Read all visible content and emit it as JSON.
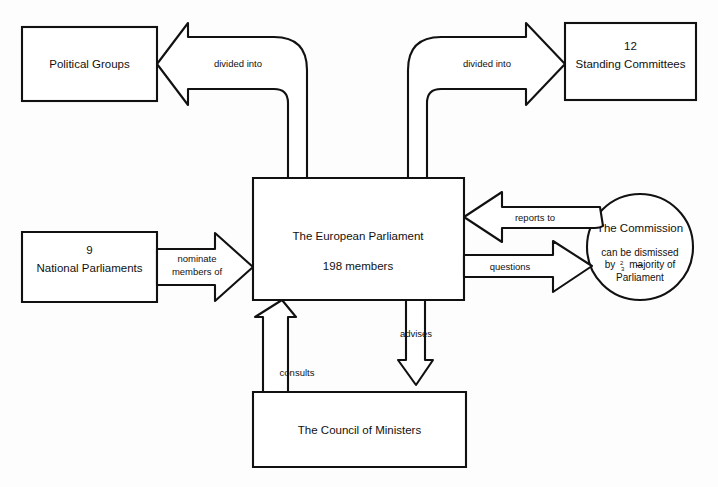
{
  "diagram": {
    "background_color": "#fdfdfd",
    "line_color": "#111111",
    "fill_color": "#ffffff",
    "nodes": {
      "political_groups": {
        "label": "Political Groups"
      },
      "standing_committees": {
        "count": "12",
        "label": "Standing Committees"
      },
      "national_parliaments": {
        "count": "9",
        "label": "National Parliaments"
      },
      "parliament": {
        "label": "The European Parliament",
        "members": "198 members"
      },
      "commission": {
        "label": "The Commission",
        "note_line1": "can be dismissed",
        "note_line2_pre": "by",
        "note_line2_frac_num": "2",
        "note_line2_frac_den": "3",
        "note_line2_post": "majority  of",
        "note_line3": "Parliament"
      },
      "council": {
        "label": "The Council of Ministers"
      }
    },
    "edges": {
      "divided_into_left": {
        "label": "divided into"
      },
      "divided_into_right": {
        "label": "divided into"
      },
      "nominate": {
        "label_line1": "nominate",
        "label_line2": "members of"
      },
      "reports_to": {
        "label": "reports to"
      },
      "questions": {
        "label": "questions"
      },
      "consults": {
        "label": "consults"
      },
      "advises": {
        "label": "advises"
      }
    }
  }
}
